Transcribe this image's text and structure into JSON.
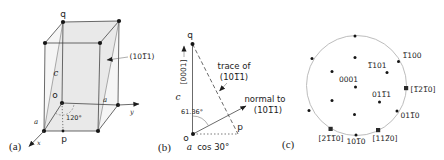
{
  "figure": {
    "background": "#ffffff",
    "ink_color": "#1c1c1c",
    "circle_color": "#bdbdbd"
  },
  "panel_a": {
    "label": "(a)",
    "vertex_q": "q",
    "origin_o": "o",
    "point_p": "p",
    "plane_label": "(101̅1)",
    "angle_label": "120°",
    "edge_a_left": "a",
    "edge_a_right": "a",
    "edge_c": "c",
    "axis_x": "x",
    "axis_y": "y"
  },
  "panel_b": {
    "label": "(b)",
    "vertex_q": "q",
    "origin_o": "o",
    "point_p": "p",
    "c_axis_direction": "[0001]",
    "edge_c": "c",
    "angle_label": "61.36°",
    "trace_line1": "trace of",
    "trace_line2": "(101̅1)",
    "normal_line1": "normal to",
    "normal_line2": "(101̅1)",
    "base_len_a": "a",
    "base_len_rest": " cos 30°"
  },
  "panel_c": {
    "label": "(c)",
    "poles": {
      "p1100": "1̅100",
      "p1101": "1̅101",
      "p0001": "0001",
      "p0111": "011̅1",
      "p0110": "011̅0",
      "p1010": "101̅0"
    },
    "directions": {
      "d1210": "[1̅21̅0]",
      "d2110": "[21̅1̅0]",
      "d1120": "[112̅0]"
    }
  }
}
